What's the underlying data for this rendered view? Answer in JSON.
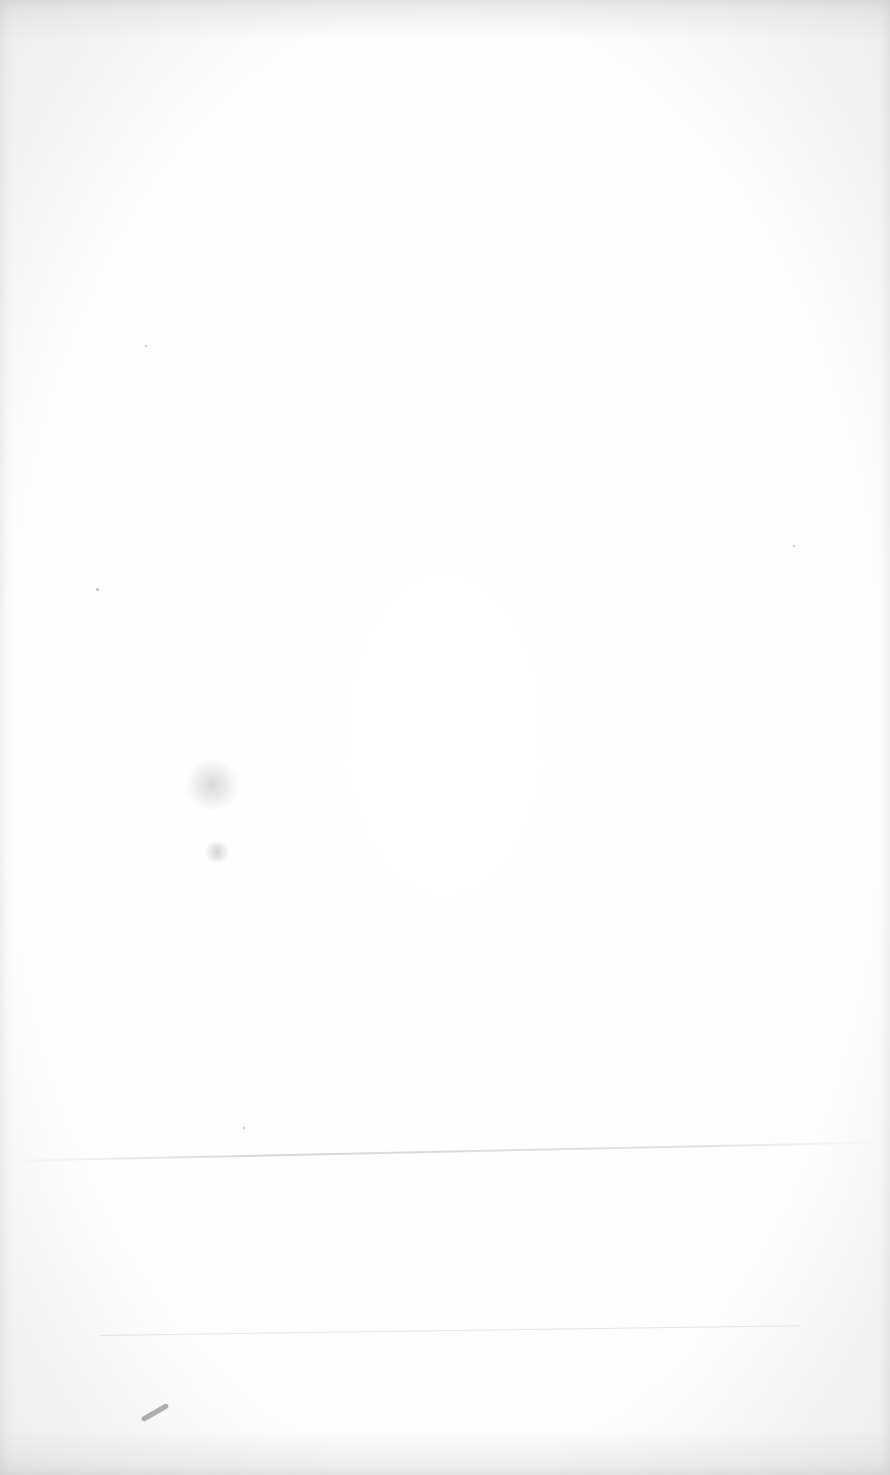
{
  "document": {
    "type": "blank-scanned-page",
    "text_content": ""
  }
}
